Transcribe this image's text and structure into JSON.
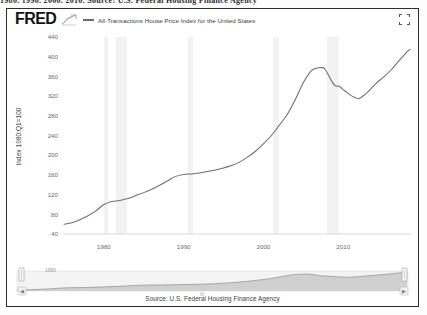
{
  "page": {
    "top_text_fragment": "1980.  1990.  2000.  2010.   Source: U.S. Federal Housing Finance Agency"
  },
  "header": {
    "logo_text": "FRED",
    "logo_squiggle_icon": "line-chart-squiggle-icon",
    "legend_label": "All-Transactions House Price Index for the United States",
    "legend_line_color": "#6d6d6d",
    "expand_icon": "fullscreen-expand-icon"
  },
  "axes": {
    "y_axis_title": "Index 1980:Q1=100",
    "y_ticks": [
      "440",
      "400",
      "360",
      "320",
      "280",
      "240",
      "200",
      "160",
      "120",
      "80",
      "40"
    ],
    "x_ticks": [
      "1980",
      "1990",
      "2000",
      "2010"
    ]
  },
  "navigator": {
    "date_label": "1980",
    "mid_label": "III",
    "left_handle_icon": "range-handle-left-icon",
    "right_handle_icon": "range-handle-right-icon",
    "area_fill_color": "#c9c9c9"
  },
  "footer": {
    "source_note": "Source: U.S. Federal Housing Finance Agency"
  },
  "chart_data": {
    "type": "line",
    "title": "All-Transactions House Price Index for the United States",
    "xlabel": "",
    "ylabel": "Index 1980:Q1=100",
    "xlim": [
      1975,
      2018.5
    ],
    "ylim": [
      40,
      440
    ],
    "y_ticks": [
      40,
      80,
      120,
      160,
      200,
      240,
      280,
      320,
      360,
      400,
      440
    ],
    "x_ticks": [
      1980,
      1990,
      2000,
      2010
    ],
    "grid": false,
    "legend_position": "top",
    "line_color": "#6d6d6d",
    "recession_band_color": "#f2f2f2",
    "recession_bands": [
      [
        1980.0,
        1980.55
      ],
      [
        1981.5,
        1982.9
      ],
      [
        1990.5,
        1991.2
      ],
      [
        2001.2,
        2001.9
      ],
      [
        2007.95,
        2009.45
      ]
    ],
    "series": [
      {
        "name": "All-Transactions House Price Index for the United States",
        "x": [
          1975.0,
          1976.0,
          1977.0,
          1978.0,
          1979.0,
          1980.0,
          1981.0,
          1982.0,
          1983.0,
          1984.0,
          1985.0,
          1986.0,
          1987.0,
          1988.0,
          1989.0,
          1990.0,
          1991.0,
          1992.0,
          1993.0,
          1994.0,
          1995.0,
          1996.0,
          1997.0,
          1998.0,
          1999.0,
          2000.0,
          2001.0,
          2002.0,
          2003.0,
          2004.0,
          2005.0,
          2006.0,
          2006.75,
          2007.25,
          2007.75,
          2008.5,
          2009.0,
          2009.5,
          2010.0,
          2010.5,
          2011.0,
          2011.5,
          2012.0,
          2013.0,
          2014.0,
          2015.0,
          2016.0,
          2017.0,
          2018.0,
          2018.4
        ],
        "values": [
          60,
          63,
          69,
          77,
          87,
          100,
          106,
          108,
          112,
          118,
          124,
          131,
          139,
          148,
          157,
          161,
          162,
          164,
          167,
          170,
          174,
          179,
          186,
          196,
          208,
          223,
          240,
          261,
          283,
          313,
          347,
          371,
          377,
          378,
          374,
          352,
          341,
          340,
          333,
          327,
          321,
          317,
          315,
          327,
          344,
          358,
          373,
          392,
          410,
          415
        ]
      }
    ]
  }
}
